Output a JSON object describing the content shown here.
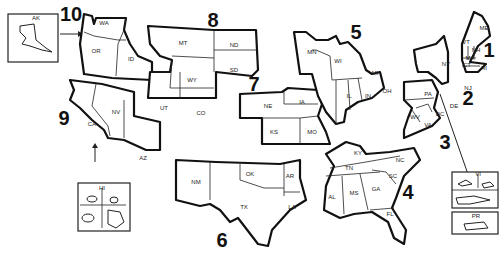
{
  "map": {
    "title": "",
    "regions": [
      {
        "number": "1",
        "states": [
          "ME",
          "VT",
          "NH",
          "MA",
          "CT",
          "RI"
        ]
      },
      {
        "number": "2",
        "states": [
          "NY",
          "NJ",
          "PR",
          "VI"
        ]
      },
      {
        "number": "3",
        "states": [
          "PA",
          "DE",
          "MD",
          "DC",
          "VA",
          "WV"
        ]
      },
      {
        "number": "4",
        "states": [
          "KY",
          "TN",
          "NC",
          "SC",
          "GA",
          "FL",
          "AL",
          "MS"
        ]
      },
      {
        "number": "5",
        "states": [
          "MN",
          "WI",
          "MI",
          "IL",
          "IN",
          "OH"
        ]
      },
      {
        "number": "6",
        "states": [
          "NM",
          "TX",
          "OK",
          "AR",
          "LA"
        ]
      },
      {
        "number": "7",
        "states": [
          "NE",
          "IA",
          "KS",
          "MO"
        ]
      },
      {
        "number": "8",
        "states": [
          "MT",
          "ND",
          "SD",
          "WY",
          "UT",
          "CO"
        ]
      },
      {
        "number": "9",
        "states": [
          "CA",
          "NV",
          "AZ",
          "HI"
        ]
      },
      {
        "number": "10",
        "states": [
          "WA",
          "OR",
          "ID",
          "AK"
        ]
      }
    ],
    "labels": {
      "AK": "AK",
      "WA": "WA",
      "OR": "OR",
      "ID": "ID",
      "CA": "CA",
      "NV": "NV",
      "AZ": "AZ",
      "HI": "HI",
      "MT": "MT",
      "ND": "ND",
      "SD": "SD",
      "WY": "WY",
      "UT": "UT",
      "CO": "CO",
      "NE": "NE",
      "IA": "IA",
      "KS": "KS",
      "MO": "MO",
      "MN": "MN",
      "WI": "WI",
      "MI": "MI",
      "IL": "IL",
      "IN": "IN",
      "OH": "OH",
      "NM": "NM",
      "OK": "OK",
      "TX": "TX",
      "AR": "AR",
      "LA": "LA",
      "KY": "KY",
      "TN": "TN",
      "NC": "NC",
      "SC": "SC",
      "GA": "GA",
      "FL": "FL",
      "AL": "AL",
      "MS": "MS",
      "PA": "PA",
      "DE": "DE",
      "DC": "DC",
      "VA": "VA",
      "WV": "WV",
      "MD": "MD",
      "NY": "NY",
      "NJ": "NJ",
      "VI": "VI",
      "PR": "PR",
      "ME": "ME",
      "VT": "VT",
      "NH": "NH",
      "MA": "MA",
      "CT": "CT",
      "RI": "RI"
    },
    "region_numbers": {
      "r1": "1",
      "r2": "2",
      "r3": "3",
      "r4": "4",
      "r5": "5",
      "r6": "6",
      "r7": "7",
      "r8": "8",
      "r9": "9",
      "r10": "10"
    }
  }
}
